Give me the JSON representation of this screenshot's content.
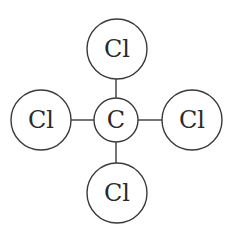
{
  "diagram": {
    "type": "molecule-structure",
    "molecule": "CCl4",
    "center_atom": {
      "label": "C",
      "cx": 116,
      "cy": 120,
      "r": 22
    },
    "outer_atoms": [
      {
        "position": "top",
        "label": "Cl",
        "cx": 117,
        "cy": 49,
        "r": 30
      },
      {
        "position": "left",
        "label": "Cl",
        "cx": 41,
        "cy": 120,
        "r": 30
      },
      {
        "position": "right",
        "label": "Cl",
        "cx": 192,
        "cy": 120,
        "r": 30
      },
      {
        "position": "bottom",
        "label": "Cl",
        "cx": 117,
        "cy": 193,
        "r": 30
      }
    ],
    "bonds": [
      {
        "from": "C",
        "to": "top"
      },
      {
        "from": "C",
        "to": "left"
      },
      {
        "from": "C",
        "to": "right"
      },
      {
        "from": "C",
        "to": "bottom"
      }
    ],
    "colors": {
      "stroke": "#3a3a3a",
      "text": "#2a2a2a",
      "background": "#ffffff"
    }
  }
}
